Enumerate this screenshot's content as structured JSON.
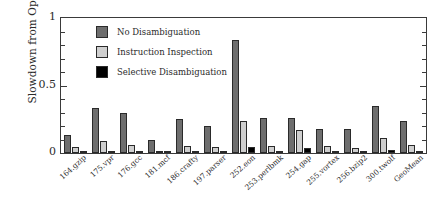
{
  "chart_data": {
    "type": "bar",
    "title": "",
    "xlabel": "",
    "ylabel": "Slowdown from Optimal",
    "ylim": [
      0,
      1
    ],
    "yticks": [
      0,
      0.5,
      1
    ],
    "ytick_labels": [
      "0",
      "0.5",
      "1"
    ],
    "grid": false,
    "legend_position": "upper left",
    "categories": [
      "164.gzip",
      "175.vpr",
      "176.gcc",
      "181.mcf",
      "186.crafty",
      "197.parser",
      "252.eon",
      "253.perlbmk",
      "254.gap",
      "255.vortex",
      "256.bzip2",
      "300.twolf",
      "GeoMean"
    ],
    "series": [
      {
        "name": "No Disambiguation",
        "color": "#6e6e6e",
        "values": [
          0.13,
          0.33,
          0.3,
          0.1,
          0.25,
          0.2,
          0.84,
          0.26,
          0.26,
          0.18,
          0.18,
          0.35,
          0.24
        ]
      },
      {
        "name": "Instruction Inspection",
        "color": "#cfcfcf",
        "values": [
          0.045,
          0.09,
          0.06,
          0.01,
          0.05,
          0.045,
          0.24,
          0.05,
          0.17,
          0.05,
          0.04,
          0.11,
          0.06
        ]
      },
      {
        "name": "Selective Disambiguation",
        "color": "#000000",
        "values": [
          0.012,
          0.005,
          0.004,
          0.003,
          0.01,
          0.009,
          0.045,
          0.004,
          0.035,
          0.006,
          0.004,
          0.02,
          0.006
        ]
      }
    ]
  }
}
